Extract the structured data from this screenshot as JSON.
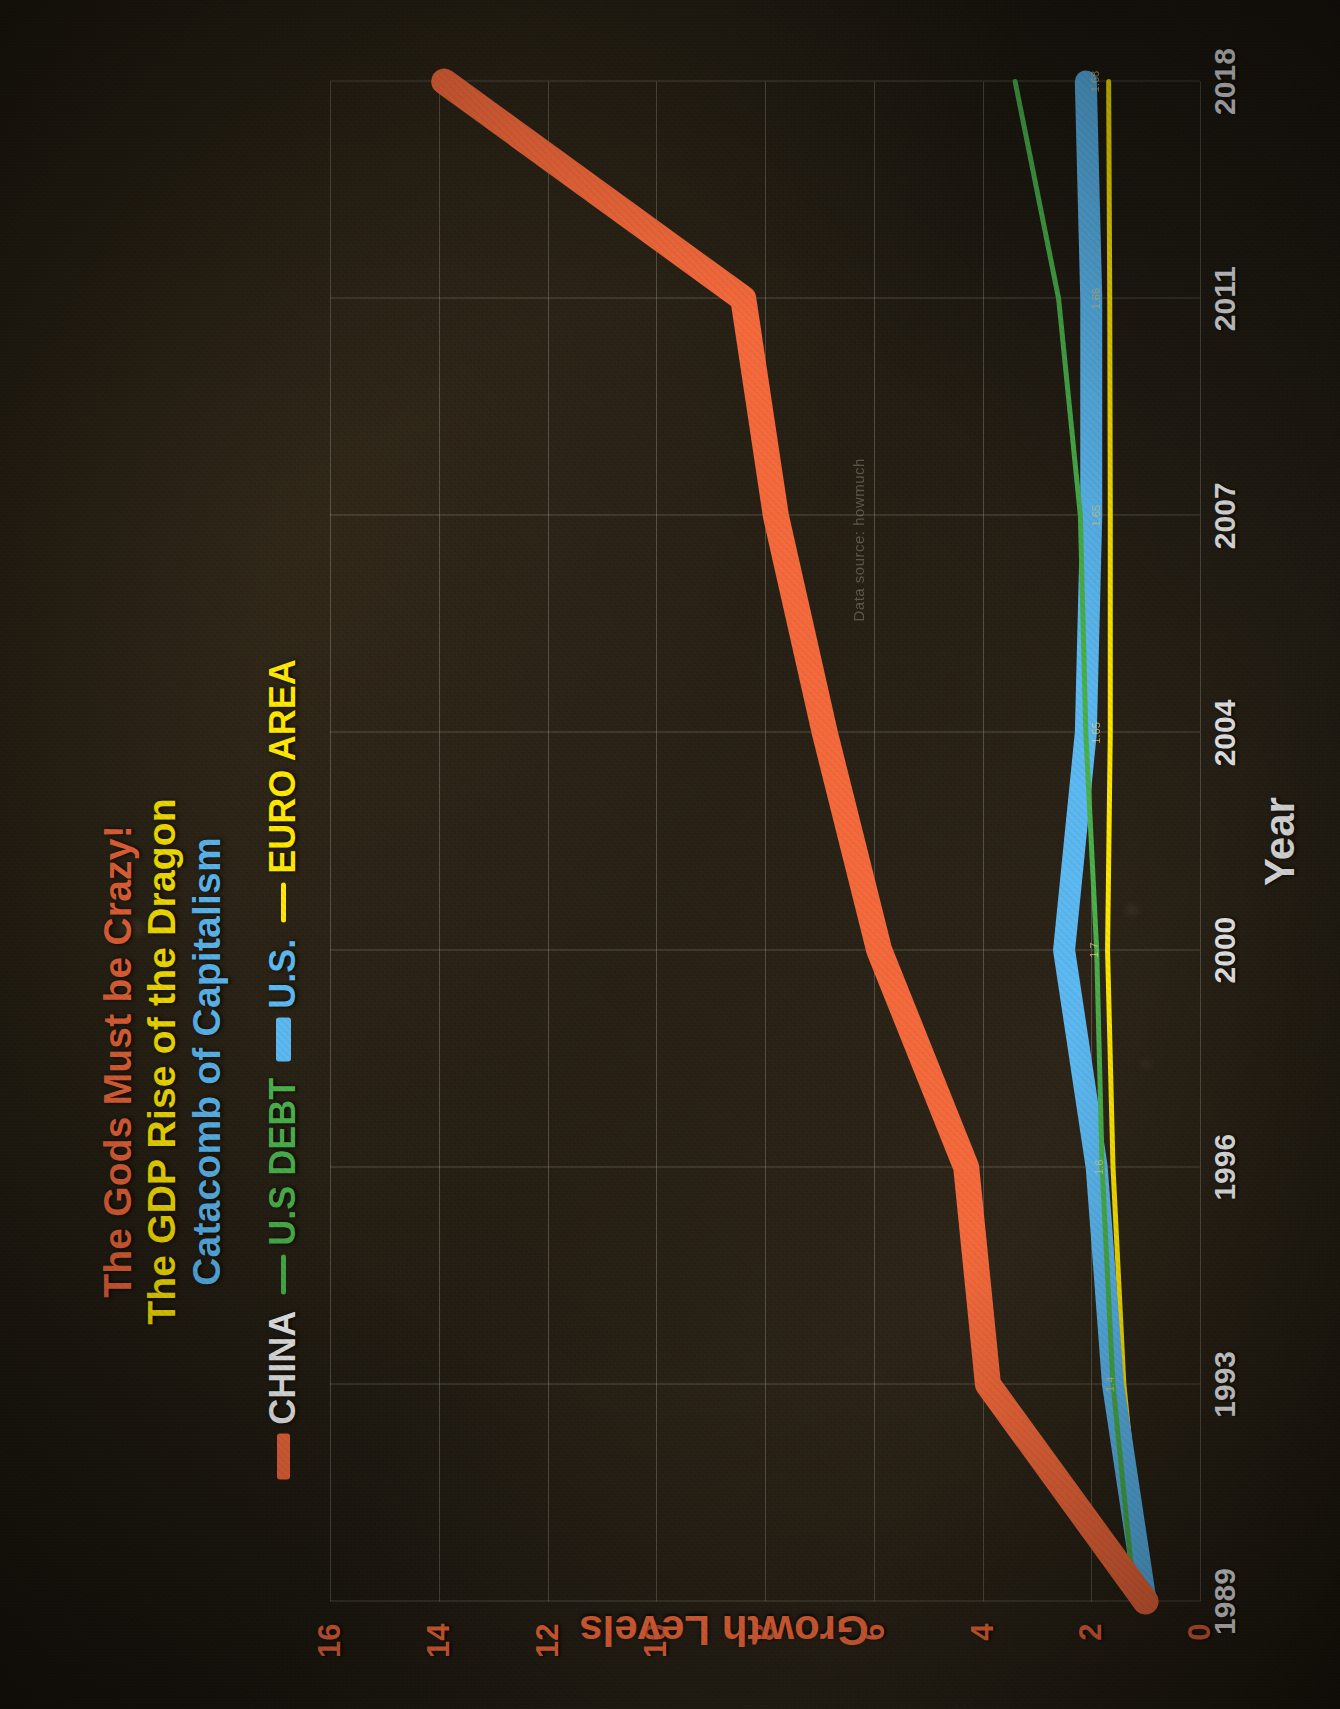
{
  "titles": {
    "line1": "The Gods Must be Crazy!",
    "line2": "The GDP Rise of the Dragon",
    "line3": "Catacomb of Capitalism",
    "color1": "#f4693b",
    "color2": "#ffe800",
    "color3": "#5bb8f0"
  },
  "legend": [
    {
      "label": "CHINA",
      "color": "#f4693b",
      "text_color": "#f2f2f2"
    },
    {
      "label": "U.S DEBT",
      "color": "#49b04a",
      "text_color": "#49b04a"
    },
    {
      "label": "U.S.",
      "color": "#5bb8f0",
      "text_color": "#5bb8f0"
    },
    {
      "label": "EURO AREA",
      "color": "#ffe800",
      "text_color": "#ffe800"
    }
  ],
  "axes": {
    "x_title": "Year",
    "y_title": "Growth Levels",
    "x_ticks": [
      "1989",
      "1993",
      "1996",
      "2000",
      "2004",
      "2007",
      "2011",
      "2018"
    ],
    "y_ticks": [
      "0",
      "2",
      "4",
      "6",
      "8",
      "10",
      "12",
      "14",
      "16"
    ]
  },
  "watermark": "Data source: howmuch",
  "chart_data": {
    "type": "line",
    "title": "The GDP Rise of the Dragon",
    "subtitle": "Catacomb of Capitalism",
    "xlabel": "Year",
    "ylabel": "Growth Levels",
    "xlim": [
      1989,
      2018
    ],
    "ylim": [
      0,
      16
    ],
    "grid": true,
    "legend_position": "top",
    "x": [
      1989,
      1993,
      1996,
      2000,
      2004,
      2007,
      2011,
      2018
    ],
    "series": [
      {
        "name": "CHINA",
        "color": "#f4693b",
        "values": [
          1.0,
          3.9,
          4.3,
          5.9,
          6.9,
          7.8,
          8.4,
          13.9
        ]
      },
      {
        "name": "U.S DEBT",
        "color": "#49b04a",
        "values": [
          1.2,
          1.6,
          1.8,
          1.9,
          2.1,
          2.2,
          2.6,
          3.4
        ]
      },
      {
        "name": "U.S.",
        "color": "#5bb8f0",
        "values": [
          1.0,
          1.6,
          1.9,
          2.5,
          2.1,
          2.0,
          2.0,
          2.1
        ]
      },
      {
        "name": "EURO AREA",
        "color": "#ffe800",
        "values": [
          1.0,
          1.4,
          1.6,
          1.7,
          1.65,
          1.65,
          1.66,
          1.68
        ]
      }
    ],
    "point_labels": [
      {
        "series": "EURO AREA",
        "x": 2018,
        "value": "1.68"
      },
      {
        "series": "EURO AREA",
        "x": 2011,
        "value": "1.66"
      },
      {
        "series": "EURO AREA",
        "x": 2007,
        "value": "1.65"
      },
      {
        "series": "EURO AREA",
        "x": 2004,
        "value": "1.65"
      },
      {
        "series": "EURO AREA",
        "x": 2000,
        "value": "1.7"
      },
      {
        "series": "EURO AREA",
        "x": 1996,
        "value": "1.6"
      },
      {
        "series": "EURO AREA",
        "x": 1993,
        "value": "1.4"
      }
    ]
  }
}
